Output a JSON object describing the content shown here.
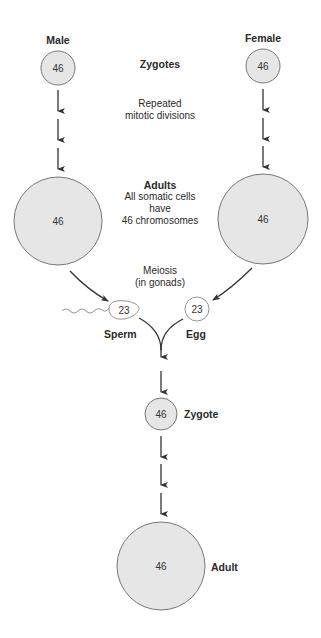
{
  "colors": {
    "cell_fill": "#e6e6e6",
    "cell_stroke": "#777777",
    "arrow": "#333333",
    "text": "#2a2a2a"
  },
  "labels": {
    "male": "Male",
    "female": "Female",
    "zygotes": "Zygotes",
    "repeated": "Repeated",
    "mitotic": "mitotic divisions",
    "adults": "Adults",
    "somatic1": "All somatic cells",
    "somatic2": "have",
    "somatic3": "46 chromosomes",
    "meiosis": "Meiosis",
    "gonads": "(in gonads)",
    "sperm": "Sperm",
    "egg": "Egg",
    "zygote": "Zygote",
    "adult": "Adult"
  },
  "cells": {
    "male_zygote": "46",
    "female_zygote": "46",
    "male_adult": "46",
    "female_adult": "46",
    "sperm": "23",
    "egg": "23",
    "zygote": "46",
    "adult": "46"
  }
}
